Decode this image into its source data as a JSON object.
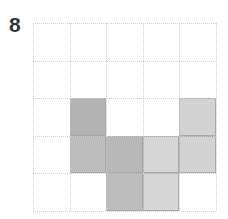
{
  "puzzle": {
    "number_label": "8",
    "rows": 5,
    "cols": 5,
    "filled_cells": [
      {
        "row": 2,
        "col": 1,
        "color": "#b3b3b3"
      },
      {
        "row": 2,
        "col": 4,
        "color": "#d3d3d3"
      },
      {
        "row": 3,
        "col": 1,
        "color": "#bdbdbd"
      },
      {
        "row": 3,
        "col": 2,
        "color": "#b8b8b8"
      },
      {
        "row": 3,
        "col": 3,
        "color": "#d6d6d6"
      },
      {
        "row": 3,
        "col": 4,
        "color": "#d3d3d3"
      },
      {
        "row": 4,
        "col": 2,
        "color": "#bdbdbd"
      },
      {
        "row": 4,
        "col": 3,
        "color": "#d6d6d6"
      }
    ]
  }
}
